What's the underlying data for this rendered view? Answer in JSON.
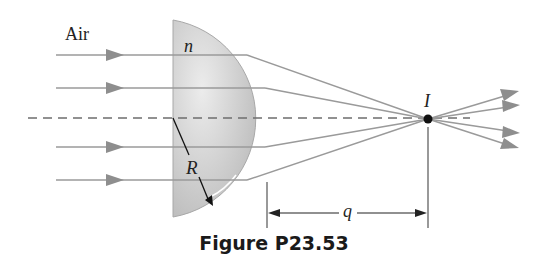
{
  "figure": {
    "caption": "Figure P23.53",
    "labels": {
      "medium": "Air",
      "index": "n",
      "radius": "R",
      "image_point": "I",
      "image_distance": "q"
    },
    "colors": {
      "ray": "#9a9a9a",
      "lens_fill": "#c8c8c8",
      "axis": "#6e6e6e",
      "ink": "#111111"
    },
    "rays": [
      {
        "y": 55
      },
      {
        "y": 88
      },
      {
        "y": 147
      },
      {
        "y": 180
      }
    ]
  }
}
